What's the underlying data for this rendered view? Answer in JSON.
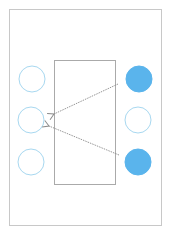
{
  "diagram": {
    "width": 171,
    "height": 233,
    "colors": {
      "frame_stroke": "#c8c8c8",
      "box_stroke": "#aaaaaa",
      "hollow_stroke": "#a8d8f0",
      "filled_fill": "#5ab4ec",
      "arrow_stroke": "#8a8a8a"
    },
    "outer_frame": {
      "x": 9,
      "y": 9,
      "width": 152,
      "height": 216
    },
    "center_box": {
      "x": 54,
      "y": 60,
      "width": 61,
      "height": 124
    },
    "left_column": [
      {
        "id": "L1",
        "cx": 32,
        "cy": 79,
        "r": 13,
        "filled": false
      },
      {
        "id": "L2",
        "cx": 31,
        "cy": 120,
        "r": 13,
        "filled": false
      },
      {
        "id": "L3",
        "cx": 31,
        "cy": 162,
        "r": 13,
        "filled": false
      }
    ],
    "right_column": [
      {
        "id": "R1",
        "cx": 139,
        "cy": 79,
        "r": 13,
        "filled": true
      },
      {
        "id": "R2",
        "cx": 138,
        "cy": 120,
        "r": 13,
        "filled": false
      },
      {
        "id": "R3",
        "cx": 138,
        "cy": 162,
        "r": 13,
        "filled": true
      }
    ],
    "arrows": [
      {
        "from": "R1",
        "to": "L2",
        "x1": 118,
        "y1": 84,
        "x2": 54,
        "y2": 114,
        "style": "dotted"
      },
      {
        "from": "R3",
        "to": "L2",
        "x1": 119,
        "y1": 155,
        "x2": 49,
        "y2": 126,
        "style": "dotted"
      }
    ]
  }
}
